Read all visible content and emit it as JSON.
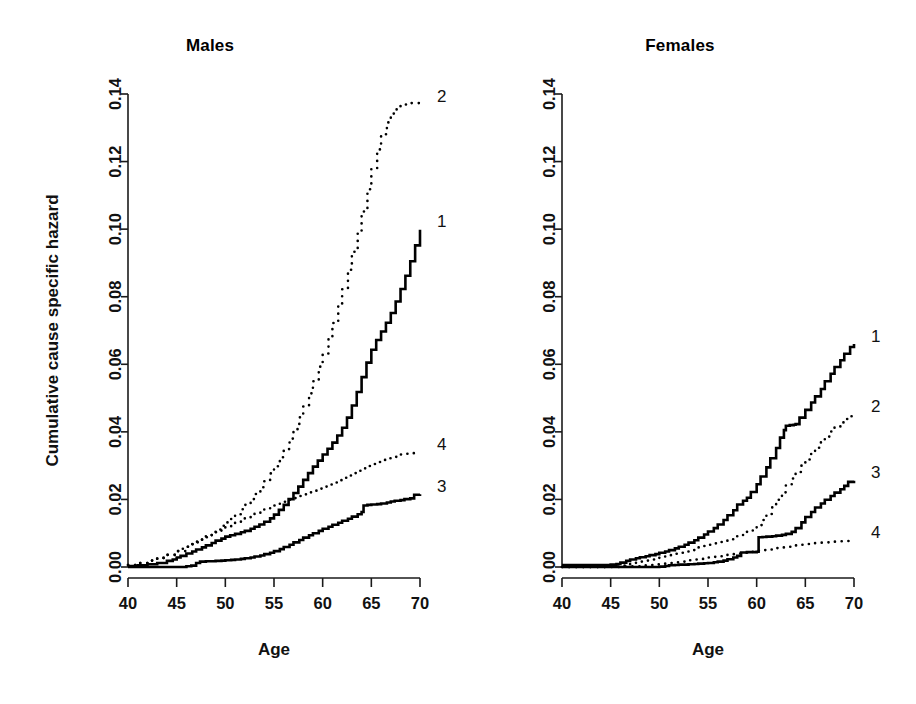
{
  "figure": {
    "background_color": "#ffffff",
    "ink_color": "#000000",
    "panels": [
      "Males",
      "Females"
    ]
  },
  "chart_data": [
    {
      "type": "line",
      "title": "Males",
      "xlabel": "Age",
      "ylabel": "Cumulative cause specific hazard",
      "xlim": [
        40,
        70
      ],
      "ylim": [
        0.0,
        0.14
      ],
      "xticks": [
        40,
        45,
        50,
        55,
        60,
        65,
        70
      ],
      "xtick_labels": [
        "40",
        "45",
        "50",
        "55",
        "60",
        "65",
        "70"
      ],
      "yticks": [
        0.0,
        0.02,
        0.04,
        0.06,
        0.08,
        0.1,
        0.12,
        0.14
      ],
      "ytick_labels": [
        "0.00",
        "0.02",
        "0.04",
        "0.06",
        "0.08",
        "0.10",
        "0.12",
        "0.14"
      ],
      "grid": false,
      "legend_position": "curve-end-labels",
      "series": [
        {
          "name": "1",
          "style": "solid",
          "end_label": "1",
          "end_value": 0.1,
          "x": [
            40,
            41,
            42,
            43,
            44,
            44.6,
            45,
            45.4,
            46,
            46.6,
            47,
            47.6,
            48,
            48.6,
            49,
            49.6,
            50,
            50.5,
            51,
            51.6,
            52,
            52.6,
            53,
            53.5,
            54,
            54.6,
            55,
            55.5,
            56,
            56.5,
            57,
            57.5,
            58,
            58.5,
            59,
            59.5,
            60,
            60.5,
            61,
            61.5,
            62,
            62.5,
            63,
            63.5,
            64,
            64.5,
            65,
            65.5,
            66,
            66.5,
            67,
            67.5,
            68,
            68.5,
            69,
            69.5,
            70
          ],
          "y": [
            0.0003,
            0.0005,
            0.0008,
            0.0012,
            0.0018,
            0.0022,
            0.0028,
            0.0033,
            0.004,
            0.0046,
            0.0052,
            0.0058,
            0.0064,
            0.0071,
            0.0078,
            0.0084,
            0.009,
            0.0094,
            0.0098,
            0.0103,
            0.0107,
            0.0113,
            0.0119,
            0.0126,
            0.0134,
            0.0144,
            0.0155,
            0.0169,
            0.0184,
            0.0201,
            0.0219,
            0.0238,
            0.0258,
            0.0278,
            0.0297,
            0.0315,
            0.0333,
            0.035,
            0.0368,
            0.0389,
            0.0412,
            0.0442,
            0.0478,
            0.0518,
            0.0562,
            0.0605,
            0.0643,
            0.0672,
            0.0697,
            0.0723,
            0.0752,
            0.0786,
            0.0823,
            0.0862,
            0.0905,
            0.0952,
            0.0998
          ]
        },
        {
          "name": "2",
          "style": "dotted",
          "end_label": "2",
          "end_value": 0.137,
          "x": [
            40,
            41,
            42,
            43,
            44,
            45,
            45.6,
            46,
            46.6,
            47,
            47.6,
            48,
            48.6,
            49,
            49.6,
            50,
            50.6,
            51,
            51.6,
            52,
            52.6,
            53,
            53.6,
            54,
            54.6,
            55,
            55.6,
            56,
            56.6,
            57,
            57.6,
            58,
            58.6,
            59,
            59.6,
            60,
            60.6,
            61,
            61.6,
            62,
            62.6,
            63,
            63.6,
            64,
            64.6,
            65,
            65.6,
            66,
            66.6,
            67,
            67.6,
            68,
            68.6,
            69,
            69.6,
            70
          ],
          "y": [
            0.0006,
            0.0012,
            0.0019,
            0.0027,
            0.0036,
            0.0047,
            0.0054,
            0.006,
            0.0068,
            0.0075,
            0.0084,
            0.0092,
            0.0102,
            0.0111,
            0.0122,
            0.0132,
            0.0145,
            0.0156,
            0.0171,
            0.0184,
            0.0201,
            0.0216,
            0.0236,
            0.0254,
            0.0277,
            0.0298,
            0.0325,
            0.0349,
            0.038,
            0.0408,
            0.0443,
            0.0475,
            0.0514,
            0.055,
            0.0593,
            0.0632,
            0.0679,
            0.0722,
            0.0774,
            0.0822,
            0.088,
            0.0933,
            0.0995,
            0.1052,
            0.1118,
            0.1178,
            0.1236,
            0.1281,
            0.1316,
            0.1342,
            0.136,
            0.1369,
            0.1372,
            0.1373,
            0.1373,
            0.1373
          ]
        },
        {
          "name": "3",
          "style": "solid",
          "end_label": "3",
          "end_value": 0.0215,
          "x": [
            40,
            42,
            44,
            45,
            46,
            46.5,
            47,
            47.4,
            48,
            48.6,
            49,
            49.6,
            50,
            50.6,
            51,
            51.6,
            52,
            52.6,
            53,
            53.6,
            54,
            54.6,
            55,
            55.6,
            56,
            56.6,
            57,
            57.6,
            58,
            58.6,
            59,
            59.6,
            60,
            60.6,
            61,
            61.6,
            62,
            62.6,
            63,
            63.6,
            64,
            64.2,
            64.6,
            65,
            65.6,
            66,
            66.6,
            67,
            67.4,
            68,
            68.4,
            69,
            69.4,
            70
          ],
          "y": [
            0.0,
            0.0,
            0.0,
            0.0,
            0.0002,
            0.0004,
            0.0012,
            0.0016,
            0.0017,
            0.0017,
            0.0018,
            0.0019,
            0.002,
            0.0021,
            0.0022,
            0.0024,
            0.0026,
            0.0028,
            0.0031,
            0.0034,
            0.0038,
            0.0042,
            0.0047,
            0.0053,
            0.0059,
            0.0066,
            0.0073,
            0.008,
            0.0087,
            0.0094,
            0.01,
            0.0107,
            0.0113,
            0.0119,
            0.0125,
            0.0131,
            0.0137,
            0.0143,
            0.0149,
            0.0156,
            0.0163,
            0.0182,
            0.0184,
            0.0185,
            0.0186,
            0.0188,
            0.0191,
            0.0194,
            0.0196,
            0.0198,
            0.0201,
            0.0203,
            0.0214,
            0.0215
          ]
        },
        {
          "name": "4",
          "style": "dotted",
          "end_label": "4",
          "end_value": 0.0338,
          "x": [
            40,
            41,
            42,
            43,
            44,
            45,
            46,
            46.6,
            47,
            47.6,
            48,
            48.6,
            49,
            49.6,
            50,
            50.6,
            51,
            51.6,
            52,
            52.6,
            53,
            53.6,
            54,
            54.6,
            55,
            55.6,
            56,
            56.6,
            57,
            57.6,
            58,
            58.6,
            59,
            59.6,
            60,
            60.6,
            61,
            61.6,
            62,
            62.6,
            63,
            63.6,
            64,
            64.6,
            65,
            65.6,
            66,
            66.6,
            67,
            67.6,
            68,
            68.6,
            69,
            69.6,
            70
          ],
          "y": [
            0.0006,
            0.0012,
            0.0019,
            0.0027,
            0.0036,
            0.0047,
            0.006,
            0.0067,
            0.0073,
            0.0081,
            0.0088,
            0.0096,
            0.0103,
            0.0111,
            0.0118,
            0.0126,
            0.0133,
            0.014,
            0.0146,
            0.0153,
            0.0159,
            0.0165,
            0.0171,
            0.0177,
            0.0182,
            0.0188,
            0.0193,
            0.0199,
            0.0204,
            0.021,
            0.0215,
            0.0221,
            0.0226,
            0.0232,
            0.0238,
            0.0244,
            0.025,
            0.0257,
            0.0264,
            0.0271,
            0.0278,
            0.0285,
            0.0292,
            0.0299,
            0.0305,
            0.0311,
            0.0317,
            0.0322,
            0.0326,
            0.033,
            0.0333,
            0.0335,
            0.0337,
            0.0338,
            0.0338
          ]
        }
      ]
    },
    {
      "type": "line",
      "title": "Females",
      "xlabel": "Age",
      "ylabel": "",
      "xlim": [
        40,
        70
      ],
      "ylim": [
        0.0,
        0.14
      ],
      "xticks": [
        40,
        45,
        50,
        55,
        60,
        65,
        70
      ],
      "xtick_labels": [
        "40",
        "45",
        "50",
        "55",
        "60",
        "65",
        "70"
      ],
      "yticks": [
        0.0,
        0.02,
        0.04,
        0.06,
        0.08,
        0.1,
        0.12,
        0.14
      ],
      "ytick_labels": [
        "0.00",
        "0.02",
        "0.04",
        "0.06",
        "0.08",
        "0.10",
        "0.12",
        "0.14"
      ],
      "grid": false,
      "legend_position": "curve-end-labels",
      "series": [
        {
          "name": "1",
          "style": "solid",
          "end_label": "1",
          "end_value": 0.066,
          "x": [
            40,
            42,
            44,
            45,
            45.6,
            46,
            46.6,
            47,
            47.6,
            48,
            48.6,
            49,
            49.6,
            50,
            50.6,
            51,
            51.6,
            52,
            52.6,
            53,
            53.6,
            54,
            54.6,
            55,
            55.6,
            56,
            56.6,
            57,
            57.6,
            58,
            58.6,
            59,
            59.4,
            60,
            60.4,
            61,
            61.4,
            62,
            62.4,
            62.8,
            63,
            63.4,
            63.8,
            64,
            64.4,
            65,
            65.6,
            66,
            66.6,
            67,
            67.6,
            68,
            68.6,
            69,
            69.6,
            70
          ],
          "y": [
            0.0006,
            0.0006,
            0.0006,
            0.0007,
            0.0009,
            0.0013,
            0.0018,
            0.0022,
            0.0026,
            0.0029,
            0.0032,
            0.0035,
            0.0038,
            0.0042,
            0.0046,
            0.005,
            0.0055,
            0.006,
            0.0066,
            0.0072,
            0.0079,
            0.0087,
            0.0096,
            0.0105,
            0.0115,
            0.0126,
            0.0139,
            0.0153,
            0.0168,
            0.0185,
            0.0196,
            0.0205,
            0.0222,
            0.0245,
            0.0268,
            0.0295,
            0.0322,
            0.0352,
            0.0383,
            0.0405,
            0.0418,
            0.042,
            0.0421,
            0.0423,
            0.0442,
            0.0465,
            0.0487,
            0.0505,
            0.0527,
            0.055,
            0.0572,
            0.0592,
            0.0612,
            0.0631,
            0.0651,
            0.066
          ]
        },
        {
          "name": "2",
          "style": "dotted",
          "end_label": "2",
          "end_value": 0.045,
          "x": [
            40,
            42,
            44,
            45,
            46,
            46.6,
            47,
            47.6,
            48,
            48.6,
            49,
            49.6,
            50,
            50.6,
            51,
            51.6,
            52,
            52.6,
            53,
            53.6,
            54,
            54.6,
            55,
            55.6,
            56,
            56.6,
            57,
            57.6,
            58,
            58.6,
            59,
            59.6,
            60,
            60.6,
            61,
            61.6,
            62,
            62.6,
            63,
            63.6,
            64,
            64.6,
            65,
            65.6,
            66,
            66.6,
            67,
            67.6,
            68,
            68.6,
            69,
            69.6,
            70
          ],
          "y": [
            0.0,
            0.0,
            0.0,
            0.0001,
            0.0004,
            0.0007,
            0.001,
            0.0013,
            0.0016,
            0.0019,
            0.0022,
            0.0025,
            0.0029,
            0.0032,
            0.0035,
            0.0039,
            0.0042,
            0.0046,
            0.005,
            0.0054,
            0.0058,
            0.0062,
            0.0066,
            0.007,
            0.0074,
            0.0078,
            0.0082,
            0.0086,
            0.0091,
            0.0097,
            0.0104,
            0.0113,
            0.0124,
            0.0139,
            0.0157,
            0.0177,
            0.0199,
            0.0221,
            0.0242,
            0.0262,
            0.0281,
            0.03,
            0.0318,
            0.0336,
            0.0353,
            0.037,
            0.0386,
            0.0401,
            0.0415,
            0.0428,
            0.0438,
            0.0446,
            0.045
          ]
        },
        {
          "name": "3",
          "style": "solid",
          "end_label": "3",
          "end_value": 0.0255,
          "x": [
            40,
            44,
            46,
            48,
            49,
            50,
            50.6,
            51,
            51.6,
            52,
            52.6,
            53,
            53.6,
            54,
            54.6,
            55,
            55.6,
            56,
            56.6,
            57,
            57.6,
            58,
            58.4,
            59,
            59.6,
            60,
            60.2,
            60.6,
            61,
            61.6,
            62,
            62.6,
            63,
            63.6,
            64,
            64.6,
            65,
            65.6,
            66,
            66.6,
            67,
            67.6,
            68,
            68.6,
            69,
            69.4,
            70
          ],
          "y": [
            0.0,
            0.0,
            0.0,
            0.0,
            0.0,
            0.0001,
            0.0003,
            0.0005,
            0.0006,
            0.0007,
            0.0007,
            0.0008,
            0.0009,
            0.001,
            0.0011,
            0.0012,
            0.0014,
            0.0016,
            0.0019,
            0.0023,
            0.0028,
            0.0033,
            0.0043,
            0.0044,
            0.0044,
            0.0045,
            0.0088,
            0.0089,
            0.009,
            0.0091,
            0.0093,
            0.0095,
            0.0098,
            0.0104,
            0.0115,
            0.0132,
            0.0148,
            0.0163,
            0.0176,
            0.0188,
            0.0199,
            0.021,
            0.022,
            0.023,
            0.024,
            0.0252,
            0.0255
          ]
        },
        {
          "name": "4",
          "style": "dotted",
          "end_label": "4",
          "end_value": 0.0078,
          "x": [
            40,
            44,
            46,
            47,
            48,
            48.6,
            49,
            49.6,
            50,
            50.6,
            51,
            51.6,
            52,
            52.6,
            53,
            53.6,
            54,
            54.6,
            55,
            55.6,
            56,
            56.6,
            57,
            57.6,
            58,
            58.6,
            59,
            59.6,
            60,
            60.6,
            61,
            61.6,
            62,
            62.6,
            63,
            63.6,
            64,
            64.6,
            65,
            65.6,
            66,
            66.6,
            67,
            67.6,
            68,
            68.6,
            69,
            69.6,
            70
          ],
          "y": [
            0.0,
            0.0,
            0.0001,
            0.0002,
            0.0004,
            0.0005,
            0.0006,
            0.0008,
            0.0009,
            0.0011,
            0.0012,
            0.0014,
            0.0016,
            0.0018,
            0.002,
            0.0022,
            0.0024,
            0.0026,
            0.0028,
            0.003,
            0.0032,
            0.0034,
            0.0036,
            0.0038,
            0.004,
            0.0042,
            0.0044,
            0.0046,
            0.0048,
            0.005,
            0.0052,
            0.0054,
            0.0056,
            0.0058,
            0.006,
            0.0062,
            0.0064,
            0.0066,
            0.0068,
            0.007,
            0.0071,
            0.0072,
            0.0073,
            0.0074,
            0.0075,
            0.0076,
            0.0077,
            0.0078,
            0.0078
          ]
        }
      ]
    }
  ]
}
